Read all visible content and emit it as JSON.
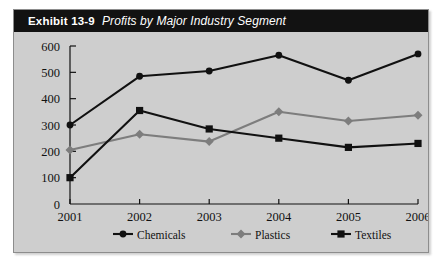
{
  "exhibit": {
    "number_label": "Exhibit 13-9",
    "caption": "Profits by Major Industry Segment"
  },
  "colors": {
    "title_bar_bg": "#121212",
    "title_text": "#ffffff",
    "panel_bg": "#cecece",
    "panel_border": "#8d8d8d",
    "axis": "#111111",
    "chemicals": "#111111",
    "plastics": "#7d7d7d",
    "textiles": "#111111"
  },
  "chart_data": {
    "type": "line",
    "title": "Profits by Major Industry Segment",
    "xlabel": "",
    "ylabel": "",
    "categories": [
      "2001",
      "2002",
      "2003",
      "2004",
      "2005",
      "2006"
    ],
    "ylim": [
      0,
      600
    ],
    "yticks": [
      0,
      100,
      200,
      300,
      400,
      500,
      600
    ],
    "ytick_labels": [
      "0",
      "100",
      "200",
      "300",
      "400",
      "500",
      "600"
    ],
    "grid": false,
    "legend_position": "bottom-center",
    "series": [
      {
        "name": "Chemicals",
        "marker": "circle",
        "color": "#111111",
        "values": [
          300,
          485,
          505,
          565,
          470,
          570
        ]
      },
      {
        "name": "Plastics",
        "marker": "diamond",
        "color": "#7d7d7d",
        "values": [
          205,
          265,
          237,
          350,
          315,
          337
        ]
      },
      {
        "name": "Textiles",
        "marker": "square",
        "color": "#111111",
        "values": [
          100,
          355,
          285,
          250,
          215,
          230
        ]
      }
    ]
  }
}
